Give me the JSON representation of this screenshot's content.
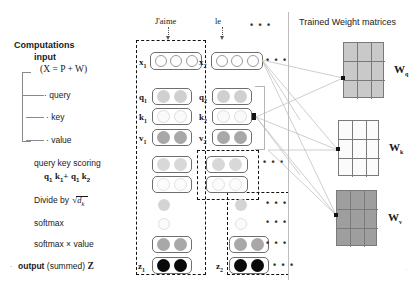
{
  "figure": {
    "title_right_panel": "Trained Weight matrices",
    "left_column_header": "Computations",
    "left_column_subheader": "input",
    "input_formula": "(X = P + W)"
  },
  "steps": [
    {
      "id": "query",
      "label": "query"
    },
    {
      "id": "key",
      "label": "key"
    },
    {
      "id": "value",
      "label": "value"
    },
    {
      "id": "scoring",
      "label": "query key scoring"
    },
    {
      "id": "divide",
      "label": "Divide by"
    },
    {
      "id": "softmax",
      "label": "softmax"
    },
    {
      "id": "smxval",
      "label": "softmax  ×   value"
    },
    {
      "id": "output",
      "label_bold": "output",
      "label_rest": "(summed)",
      "label_symbol": "Z"
    }
  ],
  "scoring_formula": {
    "term1_q": "q",
    "term1_qsub": "1",
    "term1_k": "k",
    "term1_ksub": "1",
    "plus": "+",
    "term2_q": "q",
    "term2_qsub": "1",
    "term2_k": "k",
    "term2_ksub": "2"
  },
  "divide_formula": {
    "prefix": "Divide by",
    "radical": "√",
    "radicand": "d",
    "radicand_sub": "k"
  },
  "tokens": [
    {
      "name": "J'aime",
      "x_label": "x",
      "x_sub": "1",
      "q_label": "q",
      "q_sub": "1",
      "k_label": "k",
      "k_sub": "1",
      "v_label": "v",
      "v_sub": "2",
      "z_label": "z",
      "z_sub": "1"
    },
    {
      "name": "le",
      "x_label": "x",
      "x_sub": "2",
      "q_label": "q",
      "q_sub": "2",
      "k_label": "k",
      "k_sub": "2",
      "v_label": "v",
      "v_sub": "2",
      "z_label": "z",
      "z_sub": "2"
    }
  ],
  "token_row_labels": {
    "v1": "v",
    "v1_sub": "1",
    "v2": "v",
    "v2_sub": "2"
  },
  "ellipsis": "• • •",
  "matrices": [
    {
      "id": "wq",
      "label": "W",
      "sub": "q",
      "fill": "#c9c9c9",
      "rows": 3,
      "cols": 3
    },
    {
      "id": "wk",
      "label": "W",
      "sub": "k",
      "fill": "#fbfbfb",
      "rows": 3,
      "cols": 3
    },
    {
      "id": "wv",
      "label": "W",
      "sub": "v",
      "fill": "#9e9e9e",
      "rows": 3,
      "cols": 3
    }
  ],
  "colors": {
    "dot_empty": "#ffffff",
    "dot_light": "#d0d0d0",
    "dot_faint": "#fafafa",
    "dot_medium": "#a8a8a8",
    "dot_black": "#0a0a0a",
    "box_border": "#6e6e6e",
    "dash_border": "#111111"
  }
}
